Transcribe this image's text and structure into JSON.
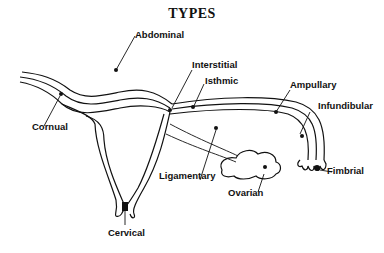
{
  "title": "TYPES",
  "labels": {
    "abdominal": "Abdominal",
    "cornual": "Cornual",
    "interstitial": "Interstitial",
    "isthmic": "Isthmic",
    "ampullary": "Ampullary",
    "infundibular": "Infundibular",
    "fimbrial": "Fimbrial",
    "ligamentary": "Ligamentary",
    "ovarian": "Ovarian",
    "cervical": "Cervical"
  },
  "colors": {
    "ink": "#111111",
    "background": "#ffffff"
  }
}
